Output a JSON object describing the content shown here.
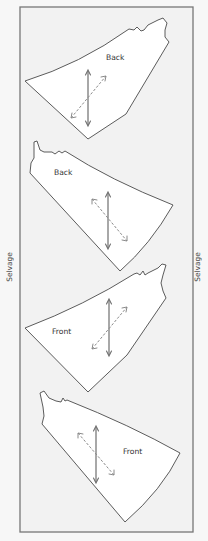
{
  "diagram": {
    "title": "",
    "colors": {
      "background": "#f7f7f7",
      "fabric_fill": "#f2f2f2",
      "fabric_border": "#777777",
      "piece_fill": "#ffffff",
      "piece_outline": "#4a4a4a",
      "grainline": "#6e6e6e",
      "bias_line": "#8a8a8a"
    },
    "selvage": {
      "left_label": "Selvage",
      "right_label": "Selvage"
    },
    "pieces": [
      {
        "label": "Back",
        "grainline": "straight-grain-arrow",
        "bias": "bias-arrow"
      },
      {
        "label": "Back",
        "grainline": "straight-grain-arrow",
        "bias": "bias-arrow"
      },
      {
        "label": "Front",
        "grainline": "straight-grain-arrow",
        "bias": "bias-arrow"
      },
      {
        "label": "Front",
        "grainline": "straight-grain-arrow",
        "bias": "bias-arrow"
      }
    ]
  }
}
